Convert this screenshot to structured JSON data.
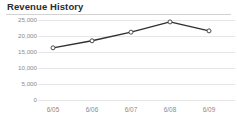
{
  "panel": {
    "title": "Revenue History",
    "background_color": "#ffffff",
    "rule_color": "#d2d2d2"
  },
  "chart_data": {
    "type": "line",
    "title": "Revenue History",
    "xlabel": "",
    "ylabel": "",
    "categories": [
      "6/05",
      "6/06",
      "6/07",
      "6/08",
      "6/09"
    ],
    "values": [
      16300,
      18500,
      21200,
      24400,
      21600
    ],
    "series": [
      {
        "name": "Revenue",
        "values": [
          16300,
          18500,
          21200,
          24400,
          21600
        ]
      }
    ],
    "ylim": [
      0,
      25000
    ],
    "ytick_values": [
      25000,
      20000,
      15000,
      10000,
      5000,
      0
    ],
    "ytick_labels": [
      "25,000",
      "20,000",
      "15,000",
      "10,000",
      "5,000",
      "0"
    ],
    "xtick_labels": [
      "6/05",
      "6/06",
      "6/07",
      "6/08",
      "6/09"
    ],
    "grid": true,
    "grid_axis": "y",
    "grid_color": "#e6e6e6",
    "legend": false,
    "legend_position": "none",
    "line_color": "#2f2f2f",
    "line_width": 1.4,
    "marker": "circle-open",
    "marker_fill": "#ffffff",
    "marker_edge_color": "#4a4a4a",
    "marker_size": 4,
    "tick_label_color": "#8a8a8a"
  }
}
